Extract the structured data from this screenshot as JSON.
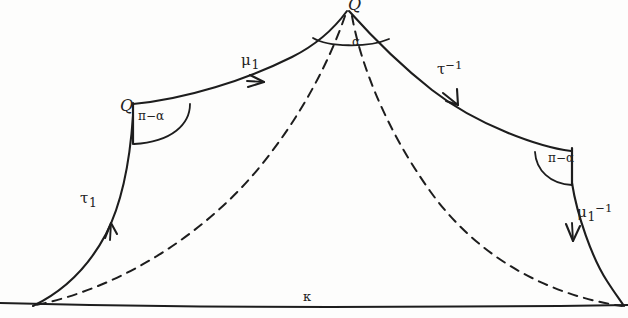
{
  "figure": {
    "kind": "hand-drawn-geodesic-diagram",
    "ink_color": "#1d1d1d",
    "paper_color": "#fdfdfc",
    "background_note": "white paper scan"
  },
  "vertices": {
    "apex": {
      "label": "Q",
      "x": 348,
      "y": 6
    },
    "left": {
      "label": "Q",
      "x": 120,
      "y": 112
    },
    "right": {
      "label": "",
      "x": 578,
      "y": 152
    },
    "bottom_left": {
      "label": "",
      "x": 32,
      "y": 305
    },
    "bottom_right": {
      "label": "",
      "x": 624,
      "y": 306
    }
  },
  "angles": {
    "apex": {
      "label": "α",
      "x": 352,
      "y": 36
    },
    "left": {
      "label": "π−α",
      "x": 138,
      "y": 110
    },
    "right": {
      "label": "π−α",
      "x": 548,
      "y": 152
    }
  },
  "curve_labels": {
    "lower_left": {
      "base": "τ",
      "sub": "1",
      "sup": "",
      "x": 80,
      "y": 191
    },
    "upper_left": {
      "base": "μ",
      "sub": "1",
      "sup": "",
      "x": 241,
      "y": 53
    },
    "upper_right": {
      "base": "τ",
      "sub": "",
      "sup": "−1",
      "x": 437,
      "y": 60
    },
    "lower_right": {
      "base": "μ",
      "sub": "1",
      "sup": "−1",
      "x": 577,
      "y": 203
    }
  },
  "baseline": {
    "label": "κ",
    "label_x": 303,
    "label_y": 290,
    "y": 306,
    "x_start": 0,
    "x_end": 628
  },
  "paths": {
    "solid_note": "four solid geodesic arcs forming a tent: bottom-left up to Q, Q across to apex, apex down to right vertex, right vertex down to baseline",
    "dashed_note": "two dashed geodesics from the apex down to the bottom-left and bottom-right corners"
  },
  "arrows": [
    {
      "on": "lower_left",
      "direction": "up-right",
      "x": 110,
      "y": 228
    },
    {
      "on": "upper_left",
      "direction": "right",
      "x": 256,
      "y": 81
    },
    {
      "on": "upper_right",
      "direction": "down-right",
      "x": 452,
      "y": 105
    },
    {
      "on": "lower_right",
      "direction": "down",
      "x": 570,
      "y": 233
    }
  ]
}
